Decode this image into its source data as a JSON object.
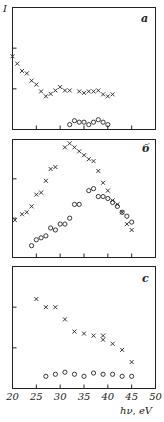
{
  "chart_data": [
    {
      "type": "scatter",
      "panel_label": "a",
      "ylabel": "I",
      "xlim": [
        20,
        50
      ],
      "series": [
        {
          "name": "crosses",
          "marker": "x",
          "x": [
            20,
            21,
            22,
            23,
            24,
            25,
            26,
            27,
            28,
            29,
            30,
            31,
            32,
            34,
            35,
            36,
            37,
            38,
            39,
            40,
            41
          ],
          "y": [
            1.5,
            1.35,
            1.2,
            1.15,
            1.0,
            0.92,
            0.78,
            0.68,
            0.73,
            0.8,
            0.87,
            0.8,
            0.8,
            0.78,
            0.75,
            0.78,
            0.78,
            0.8,
            0.72,
            0.68,
            0.72
          ]
        },
        {
          "name": "circles",
          "marker": "o",
          "x": [
            32,
            33,
            34,
            35,
            36,
            37,
            38,
            39,
            40
          ],
          "y": [
            0.1,
            0.18,
            0.15,
            0.15,
            0.1,
            0.15,
            0.2,
            0.15,
            0.1
          ]
        }
      ]
    },
    {
      "type": "scatter",
      "panel_label": "b",
      "xlim": [
        20,
        50
      ],
      "series": [
        {
          "name": "crosses",
          "marker": "x",
          "x": [
            20.5,
            22,
            23,
            24,
            25,
            26,
            27,
            28,
            29,
            31,
            32,
            33,
            34,
            35,
            36,
            37,
            38,
            39,
            40,
            41,
            42,
            43,
            44,
            45
          ],
          "y": [
            0.95,
            1.1,
            1.15,
            1.3,
            1.6,
            1.65,
            1.95,
            2.25,
            2.3,
            2.8,
            2.9,
            2.8,
            2.7,
            2.6,
            2.5,
            2.45,
            2.2,
            1.9,
            1.7,
            1.45,
            1.35,
            1.15,
            0.85,
            0.7
          ]
        },
        {
          "name": "circles",
          "marker": "o",
          "x": [
            24,
            25,
            26,
            27,
            28,
            29,
            30,
            31,
            32,
            33,
            34,
            36,
            37,
            38,
            39,
            40,
            41,
            42,
            43,
            44,
            45
          ],
          "y": [
            0.3,
            0.45,
            0.5,
            0.55,
            0.75,
            0.7,
            0.85,
            0.85,
            1.0,
            1.35,
            1.35,
            1.7,
            1.75,
            1.55,
            1.55,
            1.5,
            1.4,
            1.3,
            1.15,
            1.05,
            0.9
          ]
        }
      ]
    },
    {
      "type": "scatter",
      "panel_label": "c",
      "xlabel": "hν, eV",
      "xlim": [
        20,
        50
      ],
      "x_ticks": [
        20,
        25,
        30,
        35,
        40,
        45,
        50
      ],
      "series": [
        {
          "name": "crosses",
          "marker": "x",
          "x": [
            25,
            27,
            29,
            31,
            33,
            35,
            37,
            39,
            39,
            41,
            43,
            45
          ],
          "y": [
            2.2,
            2.0,
            2.0,
            1.7,
            1.4,
            1.35,
            1.3,
            1.3,
            1.2,
            1.1,
            0.95,
            0.65
          ]
        },
        {
          "name": "circles",
          "marker": "o",
          "x": [
            27,
            29,
            31,
            33,
            35,
            37,
            39,
            41,
            43,
            45
          ],
          "y": [
            0.3,
            0.35,
            0.4,
            0.35,
            0.3,
            0.38,
            0.35,
            0.35,
            0.3,
            0.3
          ]
        }
      ]
    }
  ],
  "labels": {
    "panel_a": "a",
    "panel_b": "б",
    "panel_c": "c",
    "y_axis": "I",
    "x_axis": "hν, eV",
    "x_ticks": [
      "20",
      "25",
      "30",
      "35",
      "40",
      "45",
      "50"
    ]
  }
}
